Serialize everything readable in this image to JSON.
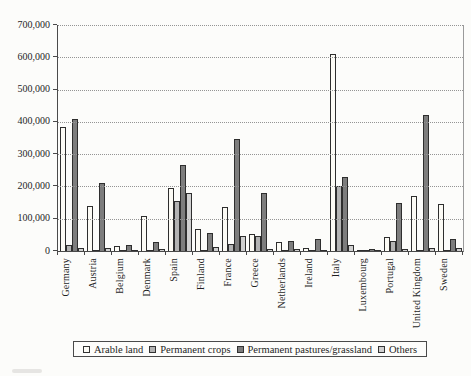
{
  "figure": {
    "background": "#fcfcfa",
    "title": ""
  },
  "chart_data": {
    "type": "bar",
    "title": "",
    "xlabel": "",
    "ylabel": "",
    "ylim": [
      0,
      700000
    ],
    "ytick_step": 100000,
    "ytick_labels": [
      "0",
      "100,000",
      "200,000",
      "300,000",
      "400,000",
      "500,000",
      "600,000",
      "700,000"
    ],
    "grid": "horizontal-dotted",
    "legend_position": "bottom-boxed",
    "categories": [
      "Germany",
      "Austria",
      "Belgium",
      "Denmark",
      "Spain",
      "Finland",
      "France",
      "Greece",
      "Netherlands",
      "Ireland",
      "Italy",
      "Luxembourg",
      "Portugal",
      "United Kingdom",
      "Sweden"
    ],
    "series": [
      {
        "name": "Arable land",
        "color": "#fcfbf5",
        "values": [
          385000,
          140000,
          15000,
          108000,
          195000,
          68000,
          135000,
          52000,
          27000,
          10000,
          610000,
          4000,
          42000,
          170000,
          145000
        ]
      },
      {
        "name": "Permanent crops",
        "color": "#b3b3b3",
        "values": [
          20000,
          4000,
          2000,
          3000,
          155000,
          2000,
          22000,
          46000,
          3000,
          1000,
          202000,
          1000,
          32000,
          3000,
          2000
        ]
      },
      {
        "name": "Permanent pastures/grassland",
        "color": "#7d7d7d",
        "values": [
          410000,
          210000,
          18000,
          28000,
          265000,
          57000,
          348000,
          180000,
          32000,
          36000,
          228000,
          5000,
          150000,
          420000,
          38000
        ]
      },
      {
        "name": "Others",
        "color": "#d0d0d0",
        "values": [
          8000,
          8000,
          2000,
          5000,
          180000,
          12000,
          46000,
          6000,
          5000,
          3000,
          18000,
          1000,
          6000,
          10000,
          10000
        ]
      }
    ],
    "colors": {
      "axis": "#4a4a4a",
      "gridline": "#949494",
      "bar_outline": "#2e2e2e"
    }
  }
}
